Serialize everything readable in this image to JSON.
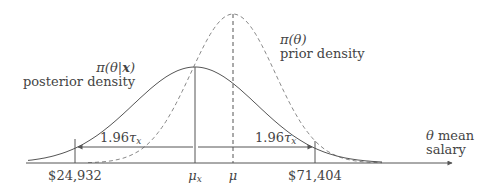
{
  "diagram": {
    "posterior": {
      "formula": "π(θ|x)",
      "formula_parts": [
        "π(θ|",
        "x",
        ")"
      ],
      "label": "posterior density",
      "mean_label": "μ",
      "mean_sub": "x"
    },
    "prior": {
      "formula": "π(θ)",
      "label": "prior density",
      "mean_label": "μ"
    },
    "interval": {
      "left_value": "$24,932",
      "right_value": "$71,404",
      "half_width_coef": "1.96",
      "half_width_symbol": "τ",
      "half_width_sub": "x"
    },
    "axis": {
      "variable": "θ",
      "label_line1": "mean",
      "label_line2": "salary"
    },
    "colors": {
      "line": "#555555",
      "text": "#444444",
      "dashed": "#888888"
    }
  }
}
